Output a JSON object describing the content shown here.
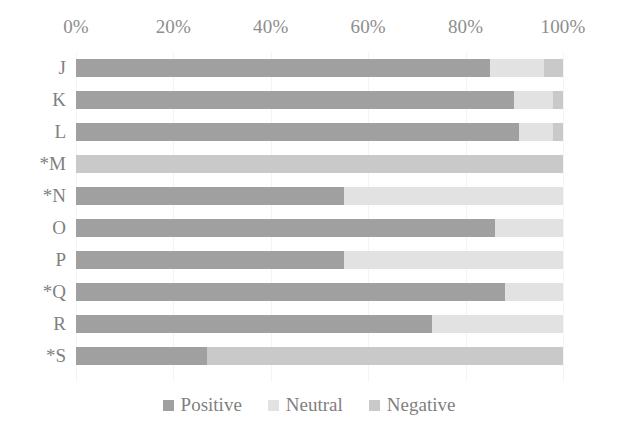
{
  "chart_data": {
    "type": "bar",
    "orientation": "horizontal",
    "stacked": true,
    "stack_mode": "percent",
    "title": "",
    "subtitle": "",
    "xlabel": "",
    "ylabel": "",
    "xlim": [
      0,
      100
    ],
    "grid": false,
    "legend_position": "bottom",
    "axis_ticks": [
      "0%",
      "20%",
      "40%",
      "60%",
      "80%",
      "100%"
    ],
    "axis_tick_values": [
      0,
      20,
      40,
      60,
      80,
      100
    ],
    "categories": [
      "J",
      "K",
      "L",
      "*M",
      "*N",
      "O",
      "P",
      "*Q",
      "R",
      "*S"
    ],
    "legend": [
      "Positive",
      "Neutral",
      "Negative"
    ],
    "series": [
      {
        "name": "Positive",
        "color": "#a0a0a0",
        "values": [
          85,
          90,
          91,
          0,
          55,
          86,
          55,
          88,
          73,
          27
        ]
      },
      {
        "name": "Neutral",
        "color": "#e2e2e2",
        "values": [
          11,
          8,
          7,
          0,
          45,
          14,
          45,
          12,
          27,
          0
        ]
      },
      {
        "name": "Negative",
        "color": "#c9c9c9",
        "values": [
          4,
          2,
          2,
          100,
          0,
          0,
          0,
          0,
          0,
          73
        ]
      }
    ]
  },
  "colors": {
    "positive": "#a0a0a0",
    "neutral": "#e2e2e2",
    "negative": "#c9c9c9",
    "text": "#808080",
    "background": "#ffffff"
  }
}
